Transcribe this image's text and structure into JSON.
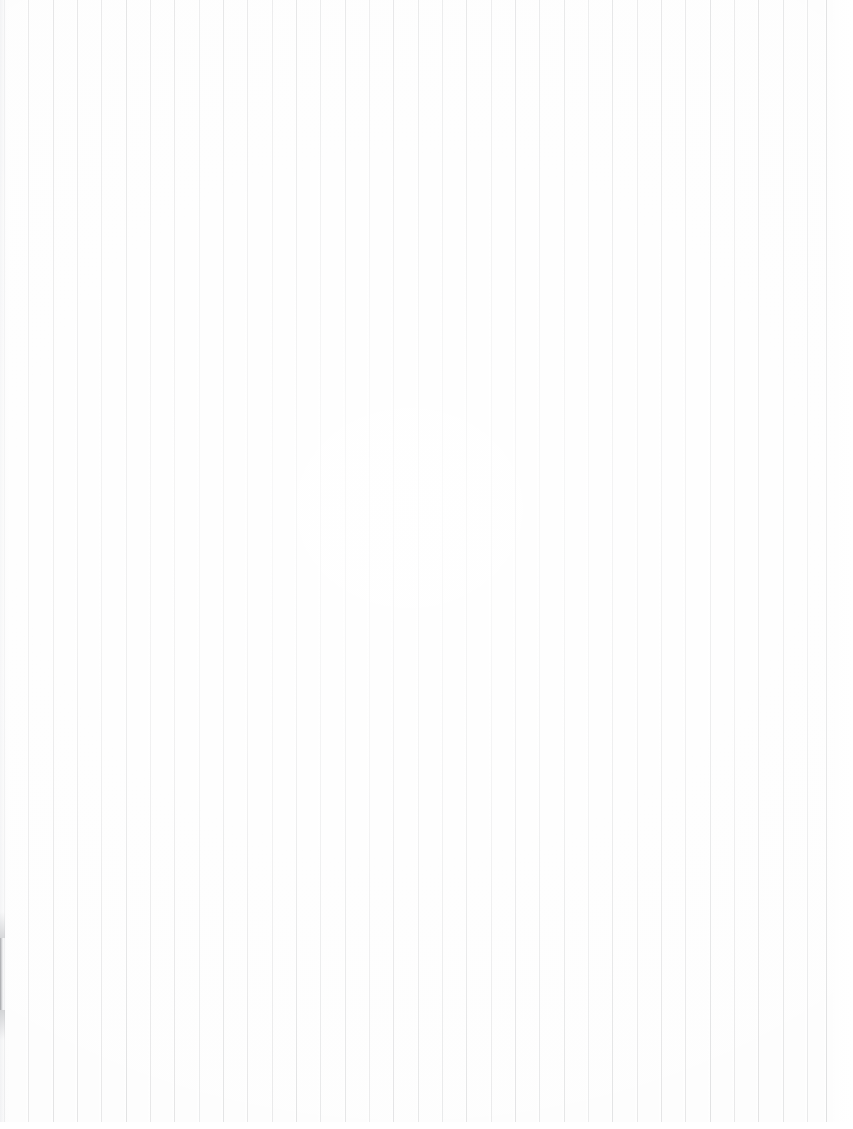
{
  "document": {
    "kind": "scanned-ruled-paper",
    "description": "Blank scanned sheet of vertically ruled paper",
    "page_width": 853,
    "page_height": 1129,
    "text_content": "",
    "visible_text": []
  },
  "paper": {
    "background_color": "#fdfdfd",
    "highlight_color": "#ffffff"
  },
  "rules": {
    "orientation": "vertical",
    "count": 35,
    "first_line_x": 4,
    "spacing_px": 24.3,
    "line_top_y": 0,
    "line_bottom_y": 1122,
    "line_width_px": 1,
    "base_color": "#c9cacc",
    "line_x_positions": [
      4,
      28,
      53,
      77,
      101,
      126,
      150,
      174,
      199,
      223,
      247,
      272,
      296,
      320,
      345,
      369,
      393,
      418,
      442,
      466,
      491,
      515,
      539,
      564,
      588,
      612,
      637,
      661,
      685,
      710,
      734,
      758,
      783,
      807,
      826
    ],
    "line_opacities": [
      0.55,
      0.5,
      0.62,
      0.58,
      0.52,
      0.66,
      0.54,
      0.6,
      0.48,
      0.64,
      0.56,
      0.5,
      0.68,
      0.53,
      0.61,
      0.47,
      0.65,
      0.57,
      0.51,
      0.63,
      0.49,
      0.67,
      0.55,
      0.59,
      0.46,
      0.64,
      0.52,
      0.6,
      0.54,
      0.66,
      0.5,
      0.62,
      0.57,
      0.48,
      0.7
    ]
  },
  "margins": {
    "right_margin_x": 830,
    "right_margin_width": 23,
    "bottom_margin_y": 1122,
    "bottom_margin_height": 7
  },
  "artifacts": {
    "left_edge_shadow": {
      "name": "scan-edge-shadow",
      "x": 0,
      "y": 938,
      "width": 5,
      "height": 72,
      "color": "#7a7c80",
      "fade_top_height": 26,
      "fade_bottom_height": 30
    }
  }
}
